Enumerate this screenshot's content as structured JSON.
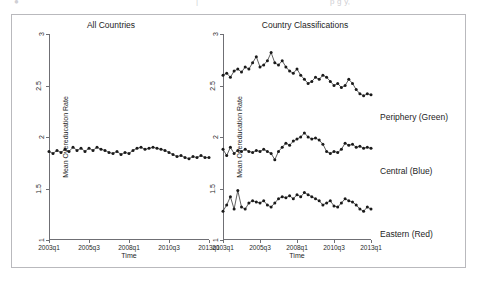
{
  "top_strip": {
    "fragments": [
      {
        "text": "●",
        "x": 14
      },
      {
        "text": "|",
        "x": 196
      },
      {
        "text": "p  g  y,",
        "x": 330
      }
    ]
  },
  "figure": {
    "panels": [
      {
        "name": "all-countries",
        "title": "All Countries",
        "xlabel": "Time",
        "ylabel": "Mean Overeducation Rate"
      },
      {
        "name": "country-classifications",
        "title": "Country Classifications",
        "xlabel": "Time",
        "ylabel": "Mean Overeducation Rate"
      }
    ],
    "legend": [
      {
        "label": "Periphery (Green)",
        "top": 97
      },
      {
        "label": "Central (Blue)",
        "top": 151
      },
      {
        "label": "Eastern (Red)",
        "top": 214
      }
    ]
  },
  "chart_data": {
    "type": "line",
    "xlabel": "Time",
    "ylabel": "Mean Overeducation Rate",
    "ylim": [
      1,
      3
    ],
    "yticks": [
      1,
      1.5,
      2,
      2.5,
      3
    ],
    "ytick_labels": [
      "1",
      "1.5",
      "2",
      "2.5",
      "3"
    ],
    "xticks": [
      0,
      10,
      20,
      30,
      40
    ],
    "xtick_labels": [
      "2003q1",
      "2005q3",
      "2008q1",
      "2010q3",
      "2013q1"
    ],
    "grid": false,
    "marker": "filled-circle",
    "legend_position": "right",
    "panels": [
      {
        "title": "All Countries",
        "series": [
          {
            "name": "All Countries",
            "color": "#1a1a1a",
            "x": [
              0,
              1,
              2,
              3,
              4,
              5,
              6,
              7,
              8,
              9,
              10,
              11,
              12,
              13,
              14,
              15,
              16,
              17,
              18,
              19,
              20,
              21,
              22,
              23,
              24,
              25,
              26,
              27,
              28,
              29,
              30,
              31,
              32,
              33,
              34,
              35,
              36,
              37,
              38,
              39,
              40
            ],
            "values": [
              1.86,
              1.84,
              1.87,
              1.85,
              1.88,
              1.86,
              1.9,
              1.87,
              1.89,
              1.86,
              1.89,
              1.87,
              1.9,
              1.88,
              1.87,
              1.85,
              1.84,
              1.86,
              1.83,
              1.85,
              1.84,
              1.87,
              1.89,
              1.9,
              1.88,
              1.89,
              1.9,
              1.89,
              1.88,
              1.87,
              1.85,
              1.83,
              1.81,
              1.82,
              1.8,
              1.79,
              1.81,
              1.8,
              1.82,
              1.8,
              1.8
            ]
          }
        ]
      },
      {
        "title": "Country Classifications",
        "series": [
          {
            "name": "Periphery (Green)",
            "color": "#1a1a1a",
            "x": [
              0,
              1,
              2,
              3,
              4,
              5,
              6,
              7,
              8,
              9,
              10,
              11,
              12,
              13,
              14,
              15,
              16,
              17,
              18,
              19,
              20,
              21,
              22,
              23,
              24,
              25,
              26,
              27,
              28,
              29,
              30,
              31,
              32,
              33,
              34,
              35,
              36,
              37,
              38,
              39,
              40
            ],
            "values": [
              2.6,
              2.62,
              2.58,
              2.64,
              2.66,
              2.63,
              2.68,
              2.66,
              2.72,
              2.78,
              2.68,
              2.7,
              2.74,
              2.82,
              2.72,
              2.7,
              2.74,
              2.68,
              2.64,
              2.62,
              2.66,
              2.6,
              2.56,
              2.52,
              2.54,
              2.58,
              2.56,
              2.6,
              2.58,
              2.54,
              2.5,
              2.52,
              2.48,
              2.5,
              2.56,
              2.52,
              2.46,
              2.42,
              2.4,
              2.42,
              2.41
            ]
          },
          {
            "name": "Central (Blue)",
            "color": "#1a1a1a",
            "x": [
              0,
              1,
              2,
              3,
              4,
              5,
              6,
              7,
              8,
              9,
              10,
              11,
              12,
              13,
              14,
              15,
              16,
              17,
              18,
              19,
              20,
              21,
              22,
              23,
              24,
              25,
              26,
              27,
              28,
              29,
              30,
              31,
              32,
              33,
              34,
              35,
              36,
              37,
              38,
              39,
              40
            ],
            "values": [
              1.88,
              1.82,
              1.9,
              1.84,
              1.87,
              1.86,
              1.88,
              1.86,
              1.85,
              1.87,
              1.86,
              1.88,
              1.86,
              1.84,
              1.78,
              1.86,
              1.9,
              1.94,
              1.92,
              1.96,
              1.98,
              2.0,
              2.04,
              2.0,
              1.98,
              1.99,
              1.97,
              1.93,
              1.86,
              1.84,
              1.86,
              1.85,
              1.88,
              1.94,
              1.92,
              1.93,
              1.9,
              1.91,
              1.89,
              1.9,
              1.89
            ]
          },
          {
            "name": "Eastern (Red)",
            "color": "#1a1a1a",
            "x": [
              0,
              1,
              2,
              3,
              4,
              5,
              6,
              7,
              8,
              9,
              10,
              11,
              12,
              13,
              14,
              15,
              16,
              17,
              18,
              19,
              20,
              21,
              22,
              23,
              24,
              25,
              26,
              27,
              28,
              29,
              30,
              31,
              32,
              33,
              34,
              35,
              36,
              37,
              38,
              39,
              40
            ],
            "values": [
              1.28,
              1.34,
              1.42,
              1.3,
              1.48,
              1.32,
              1.3,
              1.36,
              1.38,
              1.37,
              1.36,
              1.38,
              1.34,
              1.32,
              1.36,
              1.4,
              1.42,
              1.41,
              1.43,
              1.4,
              1.44,
              1.42,
              1.46,
              1.44,
              1.42,
              1.4,
              1.38,
              1.34,
              1.36,
              1.38,
              1.33,
              1.32,
              1.36,
              1.4,
              1.38,
              1.37,
              1.34,
              1.3,
              1.28,
              1.32,
              1.3
            ]
          }
        ]
      }
    ]
  }
}
